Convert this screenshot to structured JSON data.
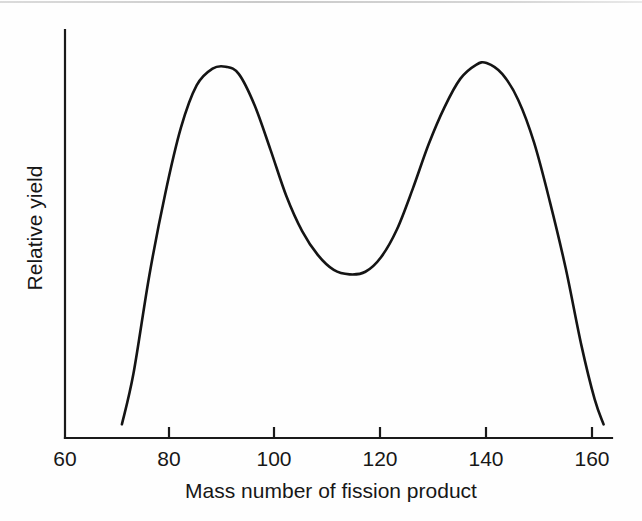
{
  "figure": {
    "background_color": "#fefefe",
    "line_color": "#141414",
    "axis_color": "#1a1a1a"
  },
  "chart_data": {
    "type": "line",
    "title": "",
    "xlabel": "Mass number of fission product",
    "ylabel": "Relative yield",
    "xlim": [
      60,
      163
    ],
    "ylim": [
      0,
      1.08
    ],
    "grid": false,
    "legend": null,
    "x_ticks": [
      60,
      80,
      100,
      120,
      140,
      160
    ],
    "x_tick_labels": [
      "60",
      "80",
      "100",
      "120",
      "140",
      "160"
    ],
    "y_ticks": [],
    "y_tick_labels": [],
    "annotations": [],
    "series": [
      {
        "name": "Fission product yield",
        "x": [
          70.8,
          73,
          76,
          79,
          82,
          85,
          88,
          90.5,
          93,
          96,
          99,
          102,
          105,
          108,
          111,
          114,
          117,
          120,
          123,
          126,
          129,
          132,
          135,
          138,
          140,
          143,
          146,
          149,
          152,
          155,
          158,
          160.5,
          162.2
        ],
        "y": [
          0.037,
          0.175,
          0.44,
          0.66,
          0.84,
          0.955,
          1.0,
          1.005,
          0.985,
          0.9,
          0.78,
          0.655,
          0.56,
          0.495,
          0.455,
          0.443,
          0.45,
          0.49,
          0.565,
          0.675,
          0.795,
          0.895,
          0.972,
          1.01,
          1.015,
          0.985,
          0.915,
          0.8,
          0.64,
          0.46,
          0.25,
          0.105,
          0.037
        ]
      }
    ],
    "peaks": [
      {
        "mass_number": 90,
        "relative_yield": 1.0,
        "label": "light-fragment peak"
      },
      {
        "mass_number": 140,
        "relative_yield": 1.015,
        "label": "heavy-fragment peak"
      }
    ],
    "valley": {
      "mass_number": 114,
      "relative_yield": 0.443,
      "label": "symmetric-fission minimum"
    }
  }
}
